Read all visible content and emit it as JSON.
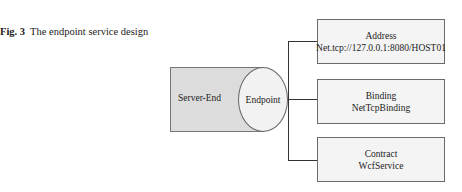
{
  "caption": {
    "label": "Fig. 3",
    "text": "The endpoint service design"
  },
  "diagram": {
    "server": {
      "label": "Server-End"
    },
    "endpoint": {
      "label": "Endpoint"
    },
    "components": [
      {
        "title": "Address",
        "value": "Net.tcp://127.0.0.1:8080/HOST01"
      },
      {
        "title": "Binding",
        "value": "NetTcpBinding"
      },
      {
        "title": "Contract",
        "value": "WcfService"
      }
    ]
  }
}
